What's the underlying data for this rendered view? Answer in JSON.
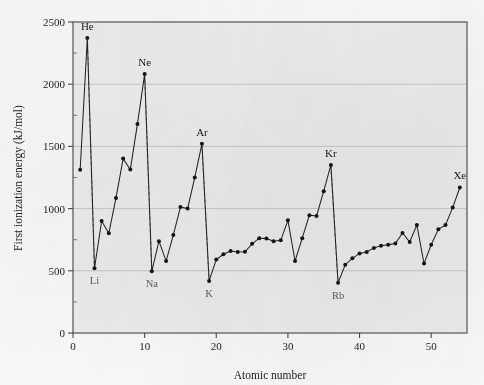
{
  "chart_data": {
    "type": "line",
    "title": "",
    "xlabel": "Atomic number",
    "ylabel": "First ionization energy (kJ/mol)",
    "xlim": [
      0,
      55
    ],
    "ylim": [
      0,
      2500
    ],
    "xticks": [
      0,
      10,
      20,
      30,
      40,
      50
    ],
    "xtick_labels": [
      "0",
      "10",
      "20",
      "30",
      "40",
      "50"
    ],
    "yticks": [
      0,
      500,
      1000,
      1500,
      2000,
      2500
    ],
    "ytick_labels": [
      "0",
      "500",
      "1000",
      "1500",
      "2000",
      "2500"
    ],
    "grid": "horizontal",
    "legend": "none",
    "marker": "filled-circle",
    "line_style": "solid",
    "drop_line_style": "dashed",
    "x": [
      1,
      2,
      3,
      4,
      5,
      6,
      7,
      8,
      9,
      10,
      11,
      12,
      13,
      14,
      15,
      16,
      17,
      18,
      19,
      20,
      21,
      22,
      23,
      24,
      25,
      26,
      27,
      28,
      29,
      30,
      31,
      32,
      33,
      34,
      35,
      36,
      37,
      38,
      39,
      40,
      41,
      42,
      43,
      44,
      45,
      46,
      47,
      48,
      49,
      50,
      51,
      52,
      53,
      54
    ],
    "values": [
      1312,
      2372,
      520,
      900,
      801,
      1086,
      1402,
      1314,
      1681,
      2081,
      496,
      738,
      578,
      787,
      1012,
      1000,
      1251,
      1521,
      419,
      590,
      633,
      659,
      651,
      653,
      717,
      762,
      760,
      737,
      745,
      906,
      579,
      762,
      947,
      941,
      1140,
      1351,
      403,
      549,
      600,
      640,
      652,
      684,
      702,
      710,
      720,
      804,
      731,
      868,
      558,
      709,
      834,
      869,
      1008,
      1170
    ],
    "element_symbols": [
      "H",
      "He",
      "Li",
      "Be",
      "B",
      "C",
      "N",
      "O",
      "F",
      "Ne",
      "Na",
      "Mg",
      "Al",
      "Si",
      "P",
      "S",
      "Cl",
      "Ar",
      "K",
      "Ca",
      "Sc",
      "Ti",
      "V",
      "Cr",
      "Mn",
      "Fe",
      "Co",
      "Ni",
      "Cu",
      "Zn",
      "Ga",
      "Ge",
      "As",
      "Se",
      "Br",
      "Kr",
      "Rb",
      "Sr",
      "Y",
      "Zr",
      "Nb",
      "Mo",
      "Tc",
      "Ru",
      "Rh",
      "Pd",
      "Ag",
      "Cd",
      "In",
      "Sn",
      "Sb",
      "Te",
      "I",
      "Xe"
    ],
    "annotations": [
      {
        "label": "He",
        "x": 2,
        "y": 2372,
        "position": "above"
      },
      {
        "label": "Ne",
        "x": 10,
        "y": 2081,
        "position": "above"
      },
      {
        "label": "Ar",
        "x": 18,
        "y": 1521,
        "position": "above"
      },
      {
        "label": "Kr",
        "x": 36,
        "y": 1351,
        "position": "above"
      },
      {
        "label": "Xe",
        "x": 54,
        "y": 1170,
        "position": "above"
      },
      {
        "label": "Li",
        "x": 3,
        "y": 520,
        "position": "below"
      },
      {
        "label": "Na",
        "x": 11,
        "y": 496,
        "position": "below"
      },
      {
        "label": "K",
        "x": 19,
        "y": 419,
        "position": "below"
      },
      {
        "label": "Rb",
        "x": 37,
        "y": 403,
        "position": "below"
      }
    ],
    "drop_lines": [
      {
        "from_label": "He",
        "x_top": 2,
        "y_top": 2372,
        "x_bottom": 3,
        "y_bottom": 520
      },
      {
        "from_label": "Ne",
        "x_top": 10,
        "y_top": 2081,
        "x_bottom": 11,
        "y_bottom": 496
      },
      {
        "from_label": "Ar",
        "x_top": 18,
        "y_top": 1521,
        "x_bottom": 19,
        "y_bottom": 419
      },
      {
        "from_label": "Kr",
        "x_top": 36,
        "y_top": 1351,
        "x_bottom": 37,
        "y_bottom": 403
      }
    ],
    "colors": {
      "line": "#222222",
      "marker": "#141414",
      "drop_line": "#8c8c8c",
      "grid": "#c8c8c8",
      "axis": "#4a4a4a",
      "plot_background": "#f1f1f1",
      "figure_background": "#fdfdfd",
      "text": "#1c1c1c",
      "sub_label_text": "#5d5d5d"
    }
  }
}
